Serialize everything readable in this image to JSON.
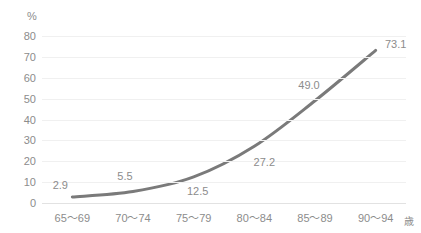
{
  "chart_data": {
    "type": "line",
    "title": "",
    "subtitle": "",
    "xlabel": "歳",
    "ylabel": "%",
    "categories": [
      "65～69",
      "70～74",
      "75～79",
      "80～84",
      "85～89",
      "90～94"
    ],
    "values": [
      2.9,
      5.5,
      12.5,
      27.2,
      49.0,
      73.1
    ],
    "point_labels": [
      "2.9",
      "5.5",
      "12.5",
      "27.2",
      "49.0",
      "73.1"
    ],
    "series": [
      {
        "name": "",
        "values": [
          2.9,
          5.5,
          12.5,
          27.2,
          49.0,
          73.1
        ]
      }
    ],
    "ylim": [
      0,
      80
    ],
    "ytick_labels": [
      "80",
      "70",
      "60",
      "50",
      "40",
      "30",
      "20",
      "10",
      "0"
    ],
    "ytick_values": [
      80,
      70,
      60,
      50,
      40,
      30,
      20,
      10,
      0
    ],
    "ystep": 10,
    "grid": true,
    "grid_axis": "y",
    "legend": false,
    "legend_position": "none",
    "smooth": true,
    "markers": false,
    "colors": {
      "line": "#7a7a7a",
      "gridline": "#f0f0f0",
      "baseline": "#e2e2e2",
      "text": "#8c8c8c",
      "background": "#ffffff"
    }
  },
  "axes": {
    "y_unit_label": "%",
    "x_unit_label": "歳"
  }
}
